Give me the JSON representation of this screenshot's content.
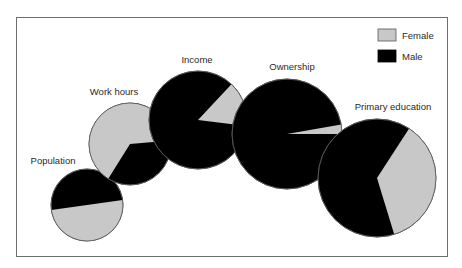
{
  "chart_data": {
    "type": "pie",
    "title": "",
    "legend": {
      "position": "top-right",
      "entries": [
        {
          "label": "Female",
          "color": "#c8c8c8"
        },
        {
          "label": "Male",
          "color": "#000000"
        }
      ]
    },
    "colors": {
      "female": "#c8c8c8",
      "male": "#000000",
      "outline": "#555555",
      "frame": "#6e6e6e"
    },
    "pies": [
      {
        "label": "Population",
        "female_pct": 50,
        "male_pct": 50,
        "cx": 87,
        "cy": 205,
        "r": 36,
        "female_start_deg": -8,
        "female_end_deg": 172,
        "label_x": 53,
        "label_y": 164
      },
      {
        "label": "Work hours",
        "female_pct": 60,
        "male_pct": 40,
        "cx": 130,
        "cy": 144,
        "r": 41,
        "female_start_deg": 122,
        "female_end_deg": 355,
        "label_x": 114,
        "label_y": 95
      },
      {
        "label": "Income",
        "female_pct": 15,
        "male_pct": 85,
        "cx": 198,
        "cy": 120,
        "r": 49,
        "female_start_deg": -47,
        "female_end_deg": 7,
        "label_x": 197,
        "label_y": 63
      },
      {
        "label": "Ownership",
        "female_pct": 5,
        "male_pct": 95,
        "cx": 287,
        "cy": 134,
        "r": 55,
        "female_start_deg": -10,
        "female_end_deg": 0,
        "label_x": 292,
        "label_y": 70
      },
      {
        "label": "Primary education",
        "female_pct": 35,
        "male_pct": 65,
        "cx": 377,
        "cy": 178,
        "r": 59,
        "female_start_deg": -57,
        "female_end_deg": 73,
        "label_x": 393,
        "label_y": 110
      }
    ]
  }
}
